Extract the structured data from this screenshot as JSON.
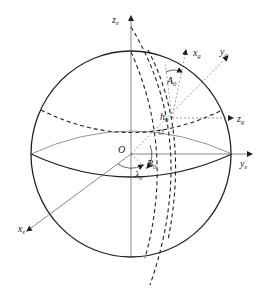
{
  "diagram": {
    "type": "coordinate-frame-sphere",
    "origin_label": "O",
    "axes": {
      "earth": [
        {
          "id": "ze",
          "base": "z",
          "sub": "e"
        },
        {
          "id": "ye",
          "base": "y",
          "sub": "e"
        },
        {
          "id": "xe",
          "base": "x",
          "sub": "e"
        }
      ],
      "local": [
        {
          "id": "xg",
          "base": "x",
          "sub": "g"
        },
        {
          "id": "yg",
          "base": "y",
          "sub": "g"
        },
        {
          "id": "zg",
          "base": "z",
          "sub": "g"
        }
      ]
    },
    "angles": [
      {
        "id": "A0",
        "base": "A",
        "sub": "0"
      },
      {
        "id": "h0",
        "base": "h",
        "sub": "0"
      },
      {
        "id": "B0",
        "base": "B",
        "sub": "0"
      },
      {
        "id": "lambda0",
        "base": "λ",
        "sub": "0"
      }
    ],
    "colors": {
      "line": "#222222",
      "thin": "#555555",
      "background": "#ffffff"
    }
  }
}
